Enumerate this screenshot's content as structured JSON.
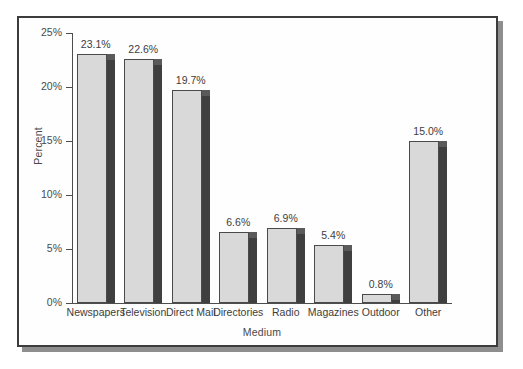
{
  "chart_data": {
    "type": "bar",
    "title": "",
    "xlabel": "Medium",
    "ylabel": "Percent",
    "categories": [
      "Newspapers",
      "Television",
      "Direct Mail",
      "Directories",
      "Radio",
      "Magazines",
      "Outdoor",
      "Other"
    ],
    "values": [
      23.1,
      22.6,
      19.7,
      6.6,
      6.9,
      5.4,
      0.8,
      15.0
    ],
    "data_labels": [
      "23.1%",
      "22.6%",
      "19.7%",
      "6.6%",
      "6.9%",
      "5.4%",
      "0.8%",
      "15.0%"
    ],
    "ylim": [
      0,
      25
    ],
    "ytick_values": [
      0,
      5,
      10,
      15,
      20,
      25
    ],
    "ytick_labels": [
      "0%",
      "5%",
      "10%",
      "15%",
      "20%",
      "25%"
    ],
    "grid": false,
    "legend": null,
    "bar_style": "3d-shaded",
    "colors": {
      "bar_face": "#d9d9d9",
      "bar_side": "#3f3f3f",
      "bar_outline": "#4a4a4a",
      "axis": "#4d4d4d",
      "text": "#3d3d3d",
      "frame": "#3c3c3c",
      "background": "#fefefe"
    }
  }
}
